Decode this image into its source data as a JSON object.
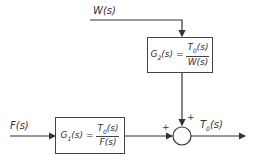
{
  "diagram": {
    "inputs": {
      "w": "W(s)",
      "f": "F(s)"
    },
    "output": "T0(s)",
    "output_parts": {
      "base": "T",
      "sub": "0",
      "arg": "(s)"
    },
    "blocks": [
      {
        "id": "G2",
        "lhs_base": "G",
        "lhs_sub": "2",
        "lhs_arg": "(s) =",
        "num_base": "T",
        "num_sub": "0",
        "num_arg": "(s)",
        "den": "W(s)"
      },
      {
        "id": "G1",
        "lhs_base": "G",
        "lhs_sub": "1",
        "lhs_arg": "(s) =",
        "num_base": "T",
        "num_sub": "0",
        "num_arg": "(s)",
        "den": "F(s)"
      }
    ],
    "summing_junction": {
      "signs": [
        "+",
        "+"
      ]
    }
  }
}
